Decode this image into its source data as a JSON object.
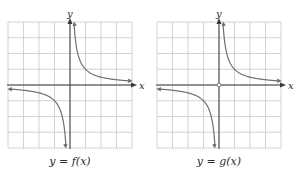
{
  "chart_data": [
    {
      "type": "line",
      "title": "",
      "caption": "y = f(x)",
      "xlabel": "x",
      "ylabel": "y",
      "grid": true,
      "grid_cells": {
        "columns": 8,
        "rows": 8
      },
      "xlim": [
        -4,
        4
      ],
      "ylim": [
        -4,
        4
      ],
      "function": "1/x (hyperbola with vertical asymptote x=0, horizontal asymptote y=0)",
      "series": [
        {
          "name": "right branch",
          "points": [
            [
              0.2,
              3.8
            ],
            [
              0.5,
              2
            ],
            [
              1,
              1
            ],
            [
              2,
              0.5
            ],
            [
              3,
              0.33
            ],
            [
              3.8,
              0.26
            ]
          ]
        },
        {
          "name": "left branch",
          "points": [
            [
              -3.8,
              -0.26
            ],
            [
              -3,
              -0.33
            ],
            [
              -2,
              -0.5
            ],
            [
              -1,
              -1
            ],
            [
              -0.5,
              -2
            ],
            [
              -0.2,
              -3.8
            ]
          ]
        }
      ],
      "annotations": []
    },
    {
      "type": "line",
      "title": "",
      "caption": "y = g(x)",
      "xlabel": "x",
      "ylabel": "y",
      "grid": true,
      "grid_cells": {
        "columns": 8,
        "rows": 8
      },
      "xlim": [
        -4,
        4
      ],
      "ylim": [
        -4,
        4
      ],
      "function": "1/x (hyperbola with vertical asymptote x=0, horizontal asymptote y=0)",
      "series": [
        {
          "name": "right branch",
          "points": [
            [
              0.2,
              3.8
            ],
            [
              0.5,
              2
            ],
            [
              1,
              1
            ],
            [
              2,
              0.5
            ],
            [
              3,
              0.33
            ],
            [
              3.8,
              0.26
            ]
          ]
        },
        {
          "name": "left branch",
          "points": [
            [
              -3.8,
              -0.26
            ],
            [
              -3,
              -0.33
            ],
            [
              -2,
              -0.5
            ],
            [
              -1,
              -1
            ],
            [
              -0.5,
              -2
            ],
            [
              -0.2,
              -3.8
            ]
          ]
        }
      ],
      "annotations": [
        {
          "type": "open-circle",
          "at": [
            0,
            0
          ]
        }
      ]
    }
  ],
  "labels": {
    "left_caption": "y = f(x)",
    "right_caption": "y = g(x)",
    "x_axis": "x",
    "y_axis": "y"
  },
  "colors": {
    "grid": "#c8c8c8",
    "axis": "#3a3a3a",
    "curve": "#6e6e6e",
    "text": "#2a2a2a"
  }
}
